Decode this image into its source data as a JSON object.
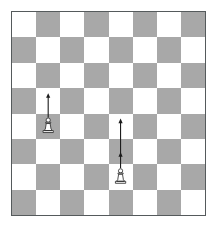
{
  "figure": {
    "kind": "chessboard-diagram"
  },
  "board": {
    "files": 8,
    "ranks": 8,
    "light_square_color": "#ffffff",
    "dark_square_color": "#a8a8a8",
    "border_color": "#555a5c",
    "top_left_square": "light",
    "square_width_px": 24.4,
    "square_height_px": 25.6,
    "origin_x_px": 11,
    "origin_y_px": 11,
    "width_px": 195,
    "height_px": 205
  },
  "pieces": [
    {
      "id": "pawn-1",
      "type": "pawn",
      "color": "white",
      "file_index": 1,
      "rank_index": 4,
      "square_color": "light"
    },
    {
      "id": "pawn-2",
      "type": "pawn",
      "color": "white",
      "file_index": 4,
      "rank_index": 6,
      "square_color": "light"
    }
  ],
  "arrows": [
    {
      "id": "arrow-1",
      "for_piece": "pawn-1",
      "direction": "up",
      "squares": 1,
      "color": "#1b1b1b",
      "has_mid_marker": false
    },
    {
      "id": "arrow-2",
      "for_piece": "pawn-2",
      "direction": "up",
      "squares": 2,
      "color": "#1b1b1b",
      "has_mid_marker": true
    }
  ]
}
